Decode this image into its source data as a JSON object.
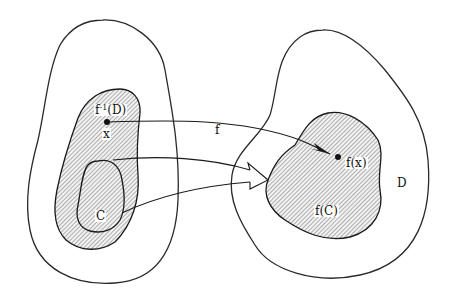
{
  "diagram": {
    "left_region": {
      "outer_set": "domain",
      "preimage_label_base": "f",
      "preimage_label_sup": "-1",
      "preimage_label_arg": "(D)",
      "point_label": "x",
      "subset_label": "C"
    },
    "right_region": {
      "set_label": "D",
      "image_label": "f(C)",
      "point_image_label": "f(x)"
    },
    "map_label": "f",
    "colors": {
      "stroke": "#1a1a1a",
      "hatch": "#555555",
      "background": "#ffffff"
    }
  }
}
